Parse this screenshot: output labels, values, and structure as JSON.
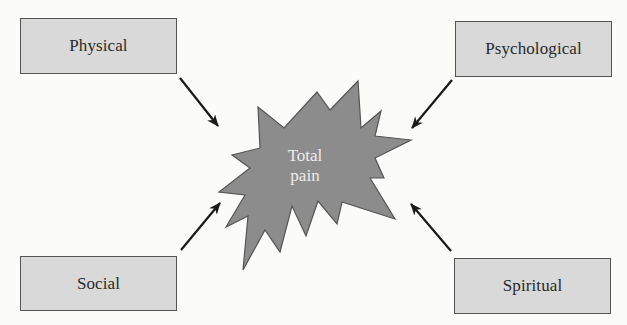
{
  "diagram": {
    "type": "concept-diagram",
    "center": {
      "label_line1": "Total",
      "label_line2": "pain",
      "shape": "starburst",
      "fill": "#8c8c8c",
      "stroke": "#555555",
      "text_color": "#ededed"
    },
    "nodes": [
      {
        "id": "physical",
        "label": "Physical",
        "position": "top-left"
      },
      {
        "id": "psychological",
        "label": "Psychological",
        "position": "top-right"
      },
      {
        "id": "social",
        "label": "Social",
        "position": "bottom-left"
      },
      {
        "id": "spiritual",
        "label": "Spiritual",
        "position": "bottom-right"
      }
    ],
    "edges": [
      {
        "from": "physical",
        "to": "center",
        "style": "arrow"
      },
      {
        "from": "psychological",
        "to": "center",
        "style": "arrow"
      },
      {
        "from": "social",
        "to": "center",
        "style": "arrow"
      },
      {
        "from": "spiritual",
        "to": "center",
        "style": "arrow"
      }
    ],
    "colors": {
      "box_fill": "#d9d9d9",
      "box_border": "#555555",
      "arrow": "#1a1a1a",
      "background": "#fbfbfa"
    }
  }
}
